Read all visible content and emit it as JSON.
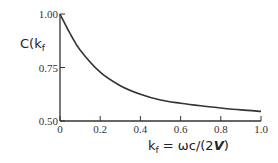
{
  "chart_data": {
    "type": "line",
    "title": "",
    "ylabel": "C(k_f",
    "xlabel": "k_f = ωc/(2V)",
    "xlim": [
      0,
      1.0
    ],
    "ylim": [
      0.5,
      1.0
    ],
    "x_ticks": [
      "0",
      "0.2",
      "0.4",
      "0.6",
      "0.8",
      "1.0"
    ],
    "y_ticks": [
      "0.50",
      "0.75",
      "1.00"
    ],
    "grid": false,
    "series": [
      {
        "name": "C(k_f)",
        "x": [
          0,
          0.05,
          0.1,
          0.2,
          0.3,
          0.4,
          0.5,
          0.6,
          0.7,
          0.8,
          0.9,
          1.0
        ],
        "y": [
          1.0,
          0.909,
          0.832,
          0.728,
          0.665,
          0.625,
          0.598,
          0.583,
          0.571,
          0.561,
          0.552,
          0.545
        ]
      }
    ]
  },
  "labels": {
    "y_axis": "C(k",
    "y_axis_sub": "f",
    "x_axis_prefix": "k",
    "x_axis_sub": "f",
    "x_axis_rest": " = ωc/(2",
    "x_axis_v": "V",
    "x_axis_end": ")"
  }
}
